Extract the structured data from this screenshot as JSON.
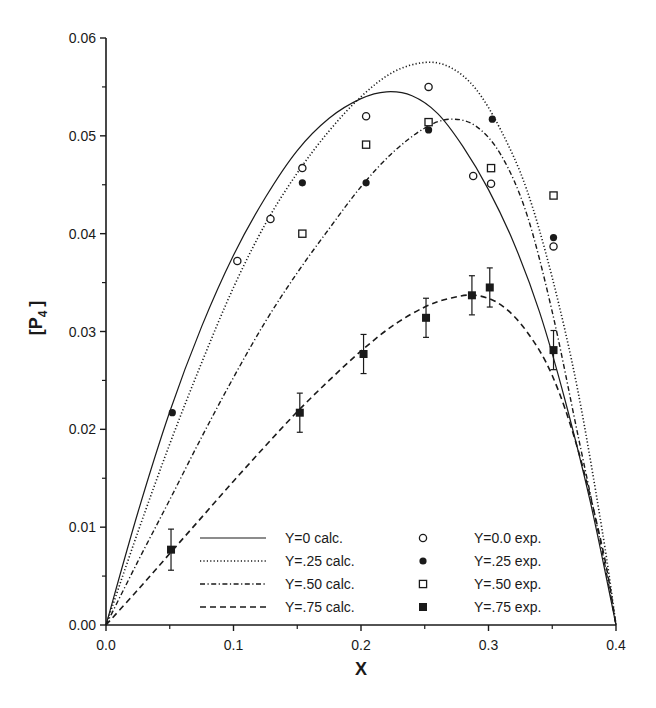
{
  "chart_data": {
    "type": "line",
    "title": "",
    "xlabel": "X",
    "ylabel": "[P4]",
    "ylabel_main": "[P",
    "ylabel_sub": "4",
    "ylabel_close": "]",
    "xlim": [
      0.0,
      0.4
    ],
    "ylim": [
      0.0,
      0.06
    ],
    "grid": false,
    "legend_position": "lower center (inside plot)",
    "x_ticks": [
      0.0,
      0.1,
      0.2,
      0.3,
      0.4
    ],
    "x_tick_labels": [
      "0.0",
      "0.1",
      "0.2",
      "0.3",
      "0.4"
    ],
    "x_minor_ticks": [
      0.05,
      0.15,
      0.25,
      0.35
    ],
    "y_ticks": [
      0.0,
      0.01,
      0.02,
      0.03,
      0.04,
      0.05,
      0.06
    ],
    "y_tick_labels": [
      "0.00",
      "0.01",
      "0.02",
      "0.03",
      "0.04",
      "0.05",
      "0.06"
    ],
    "y_minor_ticks": [
      0.005,
      0.015,
      0.025,
      0.035,
      0.045,
      0.055
    ],
    "series": [
      {
        "name": "Y=0 calc.",
        "kind": "line",
        "style": "solid",
        "x": [
          0.0,
          0.025,
          0.05,
          0.075,
          0.1,
          0.125,
          0.15,
          0.175,
          0.2,
          0.22,
          0.24,
          0.26,
          0.28,
          0.3,
          0.32,
          0.34,
          0.36,
          0.38,
          0.4
        ],
        "values": [
          0.0,
          0.0115,
          0.0218,
          0.0305,
          0.0378,
          0.0437,
          0.0485,
          0.0518,
          0.0538,
          0.0545,
          0.0541,
          0.0523,
          0.0489,
          0.0445,
          0.039,
          0.032,
          0.023,
          0.0125,
          0.0
        ]
      },
      {
        "name": "Y=.25 calc.",
        "kind": "line",
        "style": "dotted",
        "x": [
          0.0,
          0.025,
          0.05,
          0.075,
          0.1,
          0.125,
          0.15,
          0.175,
          0.2,
          0.225,
          0.25,
          0.27,
          0.29,
          0.31,
          0.33,
          0.35,
          0.37,
          0.39,
          0.4
        ],
        "values": [
          0.0,
          0.0095,
          0.0185,
          0.0268,
          0.0345,
          0.041,
          0.0462,
          0.0505,
          0.054,
          0.0565,
          0.0575,
          0.057,
          0.0548,
          0.0505,
          0.0445,
          0.0355,
          0.024,
          0.009,
          0.0
        ]
      },
      {
        "name": "Y=.50 calc.",
        "kind": "line",
        "style": "dashdot",
        "x": [
          0.0,
          0.025,
          0.05,
          0.075,
          0.1,
          0.125,
          0.15,
          0.175,
          0.2,
          0.225,
          0.25,
          0.27,
          0.29,
          0.31,
          0.33,
          0.35,
          0.37,
          0.39,
          0.4
        ],
        "values": [
          0.0,
          0.0065,
          0.0128,
          0.0192,
          0.0253,
          0.031,
          0.036,
          0.0405,
          0.0448,
          0.0483,
          0.0508,
          0.0517,
          0.051,
          0.048,
          0.042,
          0.032,
          0.0195,
          0.007,
          0.0
        ]
      },
      {
        "name": "Y=.75 calc.",
        "kind": "line",
        "style": "dashed",
        "x": [
          0.0,
          0.025,
          0.05,
          0.075,
          0.1,
          0.125,
          0.15,
          0.175,
          0.2,
          0.225,
          0.25,
          0.27,
          0.29,
          0.31,
          0.33,
          0.35,
          0.37,
          0.39,
          0.4
        ],
        "values": [
          0.0,
          0.0036,
          0.0073,
          0.011,
          0.0147,
          0.0183,
          0.0218,
          0.025,
          0.028,
          0.0306,
          0.0325,
          0.0334,
          0.0337,
          0.0327,
          0.03,
          0.0255,
          0.018,
          0.0075,
          0.0
        ]
      },
      {
        "name": "Y=0.0 exp.",
        "kind": "scatter",
        "marker": "open-circle",
        "x": [
          0.103,
          0.129,
          0.154,
          0.204,
          0.253,
          0.288,
          0.302,
          0.351
        ],
        "values": [
          0.0372,
          0.0415,
          0.0467,
          0.052,
          0.055,
          0.0459,
          0.0451,
          0.0387
        ]
      },
      {
        "name": "Y=.25 exp.",
        "kind": "scatter",
        "marker": "filled-circle",
        "x": [
          0.052,
          0.154,
          0.204,
          0.253,
          0.303,
          0.351
        ],
        "values": [
          0.0217,
          0.0452,
          0.0452,
          0.0506,
          0.0517,
          0.0396
        ]
      },
      {
        "name": "Y=.50 exp.",
        "kind": "scatter",
        "marker": "open-square",
        "x": [
          0.154,
          0.204,
          0.253,
          0.302,
          0.351
        ],
        "values": [
          0.04,
          0.0491,
          0.0514,
          0.0467,
          0.0439
        ]
      },
      {
        "name": "Y=.75 exp.",
        "kind": "scatter",
        "marker": "filled-square",
        "x": [
          0.051,
          0.152,
          0.202,
          0.251,
          0.287,
          0.301,
          0.351
        ],
        "values": [
          0.0077,
          0.0217,
          0.0277,
          0.0314,
          0.0337,
          0.0345,
          0.0281
        ],
        "error": [
          0.0021,
          0.002,
          0.002,
          0.002,
          0.002,
          0.002,
          0.002
        ]
      }
    ],
    "legend": [
      {
        "line_label": "Y=0 calc.",
        "line_style": "solid",
        "marker_label": "Y=0.0 exp.",
        "marker": "open-circle"
      },
      {
        "line_label": "Y=.25 calc.",
        "line_style": "dotted",
        "marker_label": "Y=.25 exp.",
        "marker": "filled-circle"
      },
      {
        "line_label": "Y=.50 calc.",
        "line_style": "dashdot",
        "marker_label": "Y=.50 exp.",
        "marker": "open-square"
      },
      {
        "line_label": "Y=.75 calc.",
        "line_style": "dashed",
        "marker_label": "Y=.75 exp.",
        "marker": "filled-square"
      }
    ]
  },
  "colors": {
    "ink": "#1a1a1a",
    "background": "#ffffff"
  }
}
